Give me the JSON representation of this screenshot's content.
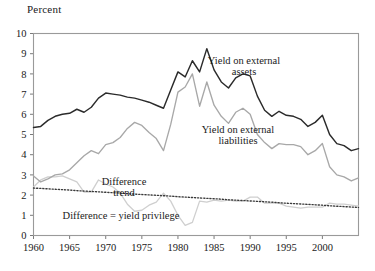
{
  "figure": {
    "y_axis_title": "Percent",
    "x_tick_labels": [
      "1960",
      "1965",
      "1970",
      "1975",
      "1980",
      "1985",
      "1990",
      "1995",
      "2000"
    ],
    "y_tick_labels": [
      "0",
      "1",
      "2",
      "3",
      "4",
      "5",
      "6",
      "7",
      "8",
      "9",
      "10"
    ],
    "labels": {
      "assets_line1": "Yield on external",
      "assets_line2": "assets",
      "liabilities_line1": "Yield on external",
      "liabilities_line2": "liabilities",
      "trend_line1": "Difference",
      "trend_line2": "trend",
      "difference": "Difference = yield privilege"
    },
    "colors": {
      "assets": "#2b2b2b",
      "liabilities": "#a8a8a8",
      "difference": "#cfcfcf",
      "trend": "#3a3a3a",
      "frame": "#9a9a9a",
      "background": "#ffffff"
    }
  },
  "chart_data": {
    "type": "line",
    "title": "",
    "subtitle": "",
    "xlabel": "",
    "ylabel": "Percent",
    "xlim": [
      1960,
      2005
    ],
    "ylim": [
      0,
      10
    ],
    "grid": false,
    "legend": "inline-annotations",
    "x_ticks": [
      1960,
      1965,
      1970,
      1975,
      1980,
      1985,
      1990,
      1995,
      2000
    ],
    "y_ticks": [
      0,
      1,
      2,
      3,
      4,
      5,
      6,
      7,
      8,
      9,
      10
    ],
    "x": [
      1960,
      1961,
      1962,
      1963,
      1964,
      1965,
      1966,
      1967,
      1968,
      1969,
      1970,
      1971,
      1972,
      1973,
      1974,
      1975,
      1976,
      1977,
      1978,
      1979,
      1980,
      1981,
      1982,
      1983,
      1984,
      1985,
      1986,
      1987,
      1988,
      1989,
      1990,
      1991,
      1992,
      1993,
      1994,
      1995,
      1996,
      1997,
      1998,
      1999,
      2000,
      2001,
      2002,
      2003,
      2004,
      2005
    ],
    "series": [
      {
        "name": "Yield on external assets",
        "color": "#2b2b2b",
        "style": "solid",
        "values": [
          5.35,
          5.4,
          5.7,
          5.9,
          6.0,
          6.05,
          6.25,
          6.1,
          6.35,
          6.8,
          7.05,
          7.0,
          6.95,
          6.85,
          6.8,
          6.7,
          6.6,
          6.45,
          6.3,
          7.2,
          8.1,
          7.85,
          8.65,
          8.1,
          9.25,
          8.2,
          7.6,
          7.3,
          7.8,
          8.0,
          7.9,
          6.9,
          6.2,
          5.9,
          6.15,
          5.95,
          5.9,
          5.75,
          5.4,
          5.6,
          5.95,
          5.0,
          4.55,
          4.45,
          4.2,
          4.3
        ]
      },
      {
        "name": "Yield on external liabilities",
        "color": "#a8a8a8",
        "style": "solid",
        "values": [
          2.95,
          2.65,
          2.8,
          3.0,
          3.05,
          3.25,
          3.6,
          3.95,
          4.2,
          4.05,
          4.5,
          4.6,
          4.85,
          5.3,
          5.6,
          5.45,
          5.1,
          4.8,
          4.2,
          5.5,
          7.1,
          7.35,
          8.0,
          6.4,
          7.6,
          6.45,
          5.9,
          5.55,
          6.1,
          6.3,
          6.0,
          5.0,
          4.6,
          4.3,
          4.55,
          4.5,
          4.5,
          4.4,
          4.0,
          4.2,
          4.55,
          3.4,
          3.0,
          2.9,
          2.7,
          2.85
        ]
      },
      {
        "name": "Difference = yield privilege",
        "color": "#cfcfcf",
        "style": "solid",
        "values": [
          2.4,
          2.75,
          2.9,
          2.9,
          2.95,
          2.8,
          2.65,
          2.15,
          2.15,
          2.75,
          2.55,
          2.4,
          2.1,
          1.55,
          1.2,
          1.25,
          1.5,
          1.65,
          2.1,
          1.7,
          1.0,
          0.5,
          0.65,
          1.7,
          1.65,
          1.75,
          1.7,
          1.75,
          1.7,
          1.7,
          1.9,
          1.9,
          1.6,
          1.6,
          1.6,
          1.45,
          1.4,
          1.35,
          1.4,
          1.4,
          1.4,
          1.6,
          1.55,
          1.55,
          1.5,
          1.45
        ]
      },
      {
        "name": "Difference trend",
        "color": "#3a3a3a",
        "style": "dotted",
        "values": [
          2.35,
          2.33,
          2.31,
          2.29,
          2.27,
          2.25,
          2.22,
          2.2,
          2.18,
          2.16,
          2.14,
          2.12,
          2.1,
          2.07,
          2.05,
          2.03,
          2.01,
          1.99,
          1.97,
          1.95,
          1.92,
          1.9,
          1.88,
          1.86,
          1.84,
          1.82,
          1.8,
          1.77,
          1.75,
          1.73,
          1.71,
          1.69,
          1.67,
          1.65,
          1.62,
          1.6,
          1.58,
          1.56,
          1.54,
          1.52,
          1.5,
          1.47,
          1.45,
          1.43,
          1.41,
          1.39
        ]
      }
    ]
  }
}
